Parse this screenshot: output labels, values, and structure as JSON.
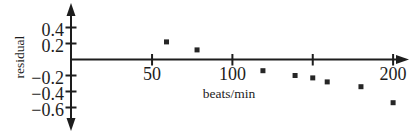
{
  "figure": {
    "background": "#ffffff",
    "ink_color": "#1d1d1d",
    "marker_color": "#262626"
  },
  "chart_data": {
    "type": "scatter",
    "title": "",
    "xlabel": "beats/min",
    "ylabel": "residual",
    "xlim": [
      0,
      210
    ],
    "ylim": [
      -0.75,
      0.55
    ],
    "grid": false,
    "legend": null,
    "marker": "filled-square",
    "xticks": [
      {
        "value": 50,
        "label": "50"
      },
      {
        "value": 100,
        "label": "100"
      },
      {
        "value": 150,
        "label": ""
      },
      {
        "value": 200,
        "label": "200"
      }
    ],
    "yticks": [
      {
        "value": 0.4,
        "label": "0.4"
      },
      {
        "value": 0.2,
        "label": "0.2"
      },
      {
        "value": -0.2,
        "label": "−0.2"
      },
      {
        "value": -0.4,
        "label": "−0.4"
      },
      {
        "value": -0.6,
        "label": "−0.6"
      }
    ],
    "points": [
      {
        "x": 59,
        "y": 0.22
      },
      {
        "x": 78,
        "y": 0.12
      },
      {
        "x": 119,
        "y": -0.14
      },
      {
        "x": 139,
        "y": -0.2
      },
      {
        "x": 150,
        "y": -0.23
      },
      {
        "x": 159,
        "y": -0.28
      },
      {
        "x": 180,
        "y": -0.34
      },
      {
        "x": 200,
        "y": -0.54
      }
    ]
  }
}
